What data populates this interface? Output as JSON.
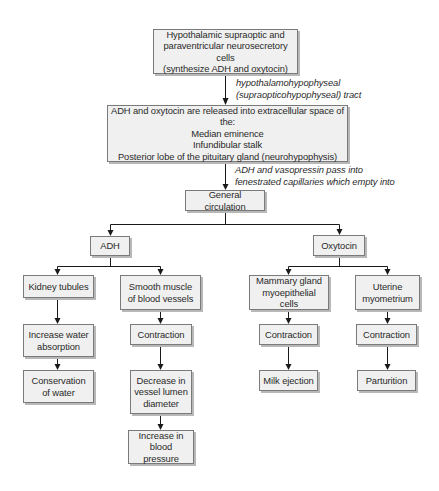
{
  "diagram": {
    "nodes": {
      "source": "Hypothalamic supraoptic and\nparaventricular neurosecretory cells\n(synthesize ADH and oxytocin)",
      "release": "ADH and oxytocin are released into extracellular space of the:\nMedian eminence\nInfundibular stalk\nPosterior lobe of the pituitary gland (neurohypophysis)",
      "circulation": "General circulation",
      "adh": "ADH",
      "oxytocin": "Oxytocin",
      "kidney": "Kidney tubules",
      "smooth_muscle": "Smooth muscle\nof blood vessels",
      "water_absorption": "Increase water\nabsorption",
      "conservation": "Conservation\nof water",
      "sm_contraction": "Contraction",
      "lumen": "Decrease in\nvessel lumen\ndiameter",
      "pressure": "Increase in\nblood pressure",
      "mammary": "Mammary gland\nmyoepithelial cells",
      "uterine": "Uterine\nmyometrium",
      "mammary_contraction": "Contraction",
      "milk": "Milk ejection",
      "uterine_contraction": "Contraction",
      "parturition": "Parturition"
    },
    "edge_labels": {
      "tract": "hypothalamohypophyseal\n(supraopticohypophyseal) tract",
      "capillaries": "ADH and vasopressin pass into\nfenestrated capillaries which empty into"
    },
    "edges": [
      [
        "source",
        "release"
      ],
      [
        "release",
        "circulation"
      ],
      [
        "circulation",
        "adh"
      ],
      [
        "circulation",
        "oxytocin"
      ],
      [
        "adh",
        "kidney"
      ],
      [
        "adh",
        "smooth_muscle"
      ],
      [
        "kidney",
        "water_absorption"
      ],
      [
        "water_absorption",
        "conservation"
      ],
      [
        "smooth_muscle",
        "sm_contraction"
      ],
      [
        "sm_contraction",
        "lumen"
      ],
      [
        "lumen",
        "pressure"
      ],
      [
        "oxytocin",
        "mammary"
      ],
      [
        "oxytocin",
        "uterine"
      ],
      [
        "mammary",
        "mammary_contraction"
      ],
      [
        "mammary_contraction",
        "milk"
      ],
      [
        "uterine",
        "uterine_contraction"
      ],
      [
        "uterine_contraction",
        "parturition"
      ]
    ],
    "colors": {
      "box_fill": "#f0f0f0",
      "box_border": "#7a7a7a",
      "box_shadow": "#b8b8b8",
      "line": "#1a1a1a",
      "text": "#2a2a2a"
    }
  }
}
